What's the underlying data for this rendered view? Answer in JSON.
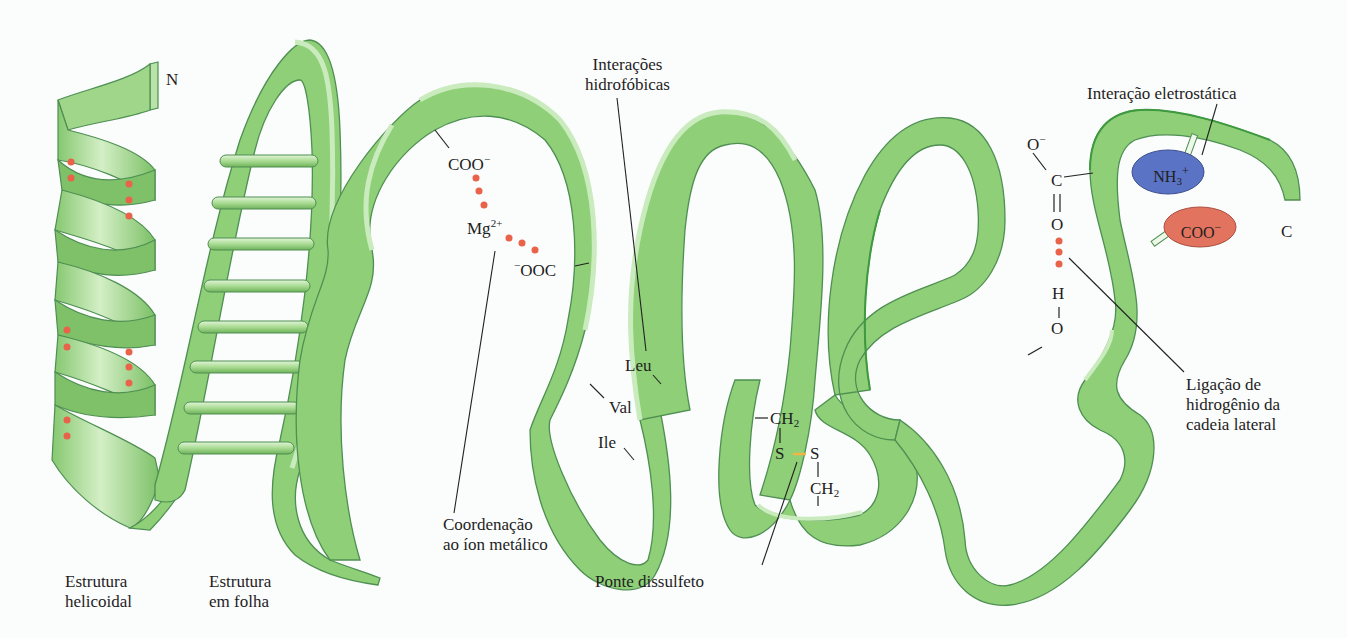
{
  "figure": {
    "colors": {
      "ribbon_fill": "#8fcf78",
      "ribbon_edge": "#c9ebbd",
      "ribbon_stroke": "#4e8f52",
      "bond_dots": "#e8634a",
      "disulfide_bond": "#f2b545",
      "ammonium_ellipse": "#5a73c4",
      "carboxylate_ellipse": "#e2735f",
      "leader_line": "#222222"
    }
  },
  "termini": {
    "n_terminus": "N",
    "c_terminus": "C"
  },
  "labels": {
    "helix": [
      "Estrutura",
      "helicoidal"
    ],
    "sheet": [
      "Estrutura",
      "em folha"
    ],
    "metal_coordination": [
      "Coordenação",
      "ao íon metálico"
    ],
    "hydrophobic": [
      "Interações",
      "hidrofóbicas"
    ],
    "disulfide": "Ponte dissulfeto",
    "electrostatic": "Interação eletrostática",
    "hydrogen_bond": [
      "Ligação de",
      "hidrogênio da",
      "cadeia lateral"
    ]
  },
  "chemistry": {
    "metal_site": {
      "carboxylate_1": "COO",
      "carboxylate_1_charge": "−",
      "metal": "Mg",
      "metal_charge": "2+",
      "carboxylate_2_charge": "−",
      "carboxylate_2": "OOC"
    },
    "hydrophobic_residues": [
      "Leu",
      "Val",
      "Ile"
    ],
    "disulfide": {
      "ch2_top": "CH",
      "ch2_top_sub": "2",
      "s_left": "S",
      "s_right": "S",
      "ch2_bottom": "CH",
      "ch2_bottom_sub": "2"
    },
    "hbond": {
      "o_minus": "O",
      "o_minus_charge": "−",
      "c": "C",
      "o_double": "O",
      "h": "H",
      "o_bottom": "O"
    },
    "salt_bridge": {
      "ammonium": "NH",
      "ammonium_sub": "3",
      "ammonium_charge": "+",
      "carboxylate": "COO",
      "carboxylate_charge": "−"
    }
  }
}
